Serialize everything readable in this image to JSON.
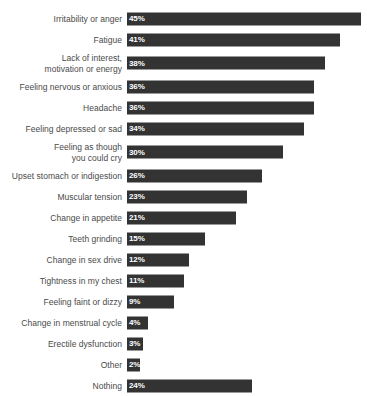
{
  "chart_data": {
    "type": "bar",
    "orientation": "horizontal",
    "title": "",
    "subtitle": "",
    "xlabel": "",
    "ylabel": "",
    "grid": false,
    "legend": null,
    "legend_position": "none",
    "value_suffix": "%",
    "xlim": [
      0,
      45
    ],
    "bar_color": "#333333",
    "label_color": "#4a4a4a",
    "value_label_color": "#ffffff",
    "background": "#ffffff",
    "categories": [
      "Irritability or anger",
      "Fatigue",
      "Lack of interest,\nmotivation or energy",
      "Feeling nervous or anxious",
      "Headache",
      "Feeling depressed or sad",
      "Feeling as though\nyou could cry",
      "Upset stomach or indigestion",
      "Muscular tension",
      "Change in appetite",
      "Teeth grinding",
      "Change in sex drive",
      "Tightness in my chest",
      "Feeling faint or dizzy",
      "Change in menstrual cycle",
      "Erectile dysfunction",
      "Other",
      "Nothing"
    ],
    "values": [
      45,
      41,
      38,
      36,
      36,
      34,
      30,
      26,
      23,
      21,
      15,
      12,
      11,
      9,
      4,
      3,
      2,
      24
    ],
    "value_labels": [
      "45%",
      "41%",
      "38%",
      "36%",
      "36%",
      "34%",
      "30%",
      "26%",
      "23%",
      "21%",
      "15%",
      "12%",
      "11%",
      "9%",
      "4%",
      "3%",
      "2%",
      "24%"
    ],
    "rows": [
      {
        "label": "Irritability or anger",
        "value": 45,
        "value_label": "45%",
        "two_line": false
      },
      {
        "label": "Fatigue",
        "value": 41,
        "value_label": "41%",
        "two_line": false
      },
      {
        "label": "Lack of interest,\nmotivation or energy",
        "value": 38,
        "value_label": "38%",
        "two_line": true
      },
      {
        "label": "Feeling nervous or anxious",
        "value": 36,
        "value_label": "36%",
        "two_line": false
      },
      {
        "label": "Headache",
        "value": 36,
        "value_label": "36%",
        "two_line": false
      },
      {
        "label": "Feeling depressed or sad",
        "value": 34,
        "value_label": "34%",
        "two_line": false
      },
      {
        "label": "Feeling as though\nyou could cry",
        "value": 30,
        "value_label": "30%",
        "two_line": true
      },
      {
        "label": "Upset stomach or indigestion",
        "value": 26,
        "value_label": "26%",
        "two_line": false
      },
      {
        "label": "Muscular tension",
        "value": 23,
        "value_label": "23%",
        "two_line": false
      },
      {
        "label": "Change in appetite",
        "value": 21,
        "value_label": "21%",
        "two_line": false
      },
      {
        "label": "Teeth grinding",
        "value": 15,
        "value_label": "15%",
        "two_line": false
      },
      {
        "label": "Change in sex drive",
        "value": 12,
        "value_label": "12%",
        "two_line": false
      },
      {
        "label": "Tightness in my chest",
        "value": 11,
        "value_label": "11%",
        "two_line": false
      },
      {
        "label": "Feeling faint or dizzy",
        "value": 9,
        "value_label": "9%",
        "two_line": false
      },
      {
        "label": "Change in menstrual cycle",
        "value": 4,
        "value_label": "4%",
        "two_line": false
      },
      {
        "label": "Erectile dysfunction",
        "value": 3,
        "value_label": "3%",
        "two_line": false
      },
      {
        "label": "Other",
        "value": 2,
        "value_label": "2%",
        "two_line": false
      },
      {
        "label": "Nothing",
        "value": 24,
        "value_label": "24%",
        "two_line": false
      }
    ]
  }
}
